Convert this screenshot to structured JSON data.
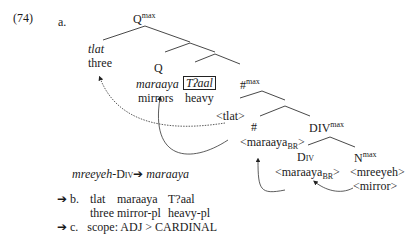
{
  "example": {
    "number": "(74)",
    "label_a": "a.",
    "tree": {
      "root": {
        "label": "Q",
        "sup": "max"
      },
      "tlat": {
        "word": "tlat",
        "gloss": "three"
      },
      "q": {
        "label": "Q"
      },
      "maraaya": {
        "word": "maraaya",
        "gloss": "mirrors"
      },
      "adj": {
        "word": "Tʔaal",
        "gloss": "heavy"
      },
      "hashmax": {
        "label": "#",
        "sup": "max"
      },
      "tlat_trace": "<tlat>",
      "hash": {
        "label": "#"
      },
      "maraaya_br1": {
        "text": "<maraaya",
        "sub": "BR",
        "close": ">"
      },
      "divmax": {
        "label": "DIV",
        "sup": "max"
      },
      "div": {
        "label": "Div"
      },
      "maraaya_br2": {
        "text": "<maraaya",
        "sub": "BR",
        "close": ">"
      },
      "nmax": {
        "label": "N",
        "sup": "max"
      },
      "mreeyeh": "<mreeyeh>",
      "mirror": "<mirror>"
    },
    "rule": {
      "left": "mreeyeh",
      "mid": "-Div",
      "arrow": "➔",
      "right": "maraaya"
    },
    "b": {
      "arrow": "➔",
      "label": "b.",
      "line1": [
        "tlat",
        "maraaya",
        "T?aal"
      ],
      "line2": [
        "three",
        "mirror-pl",
        "heavy-pl"
      ]
    },
    "c": {
      "arrow": "➔",
      "label": "c.",
      "text": "scope: ADJ > CARDINAL"
    }
  }
}
